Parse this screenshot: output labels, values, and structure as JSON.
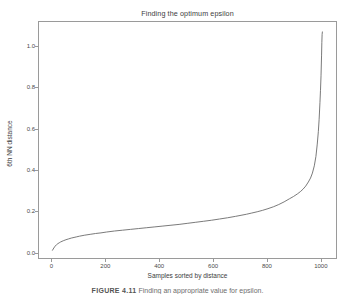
{
  "figure": {
    "caption_label": "FIGURE 4.11",
    "caption_text": "Finding an appropriate value for epsilon."
  },
  "chart_data": {
    "type": "line",
    "title": "Finding the optimum epsilon",
    "xlabel": "Samples sorted by distance",
    "ylabel": "6th NN distance",
    "xlim": [
      -50,
      1060
    ],
    "ylim": [
      -0.03,
      1.12
    ],
    "grid": false,
    "legend": null,
    "xticks": [
      0,
      200,
      400,
      600,
      800,
      1000
    ],
    "xtick_labels": [
      "0",
      "200",
      "400",
      "600",
      "800",
      "1000"
    ],
    "yticks": [
      0.0,
      0.2,
      0.4,
      0.6,
      0.8,
      1.0
    ],
    "ytick_labels": [
      "0.0",
      "0.2",
      "0.4",
      "0.6",
      "0.8",
      "1.0"
    ],
    "line_color": "#6b6b6b",
    "line_width": 0.9,
    "series": [
      {
        "name": "6th NN distance",
        "x": [
          0,
          5,
          10,
          15,
          20,
          25,
          30,
          40,
          50,
          60,
          70,
          80,
          90,
          100,
          120,
          140,
          160,
          180,
          200,
          230,
          260,
          290,
          320,
          350,
          380,
          410,
          440,
          470,
          500,
          530,
          560,
          590,
          620,
          650,
          680,
          700,
          720,
          740,
          760,
          780,
          800,
          820,
          840,
          860,
          880,
          895,
          910,
          920,
          930,
          940,
          950,
          958,
          965,
          972,
          978,
          983,
          987,
          990,
          993,
          995,
          997,
          999,
          1000,
          1001,
          1002
        ],
        "y": [
          0.017,
          0.028,
          0.037,
          0.044,
          0.049,
          0.053,
          0.057,
          0.063,
          0.068,
          0.072,
          0.076,
          0.079,
          0.082,
          0.085,
          0.09,
          0.094,
          0.098,
          0.101,
          0.105,
          0.11,
          0.114,
          0.118,
          0.122,
          0.126,
          0.13,
          0.134,
          0.138,
          0.142,
          0.147,
          0.152,
          0.157,
          0.162,
          0.168,
          0.174,
          0.181,
          0.186,
          0.191,
          0.197,
          0.203,
          0.21,
          0.218,
          0.227,
          0.238,
          0.251,
          0.266,
          0.277,
          0.29,
          0.3,
          0.312,
          0.327,
          0.347,
          0.366,
          0.39,
          0.425,
          0.47,
          0.53,
          0.59,
          0.65,
          0.73,
          0.79,
          0.86,
          0.96,
          1.02,
          1.06,
          1.072
        ]
      }
    ]
  }
}
